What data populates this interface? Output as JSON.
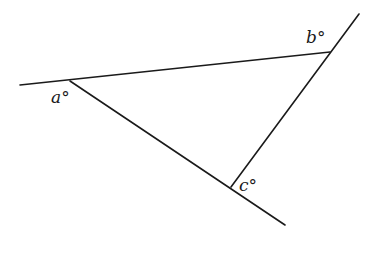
{
  "diagram": {
    "type": "geometry-triangle-extended-lines",
    "canvas": {
      "width": 371,
      "height": 255,
      "background": "#ffffff"
    },
    "stroke_color": "#1a1a1a",
    "lines": [
      {
        "id": "top-line",
        "x1": 20,
        "y1": 85,
        "x2": 330,
        "y2": 52
      },
      {
        "id": "right-line",
        "x1": 359,
        "y1": 14,
        "x2": 231,
        "y2": 187
      },
      {
        "id": "diagonal-line",
        "x1": 70,
        "y1": 81,
        "x2": 285,
        "y2": 225
      }
    ],
    "vertices": {
      "a": {
        "x": 70,
        "y": 81
      },
      "b": {
        "x": 330,
        "y": 52
      },
      "c": {
        "x": 231,
        "y": 187
      }
    },
    "labels": [
      {
        "id": "angle-a",
        "text": "a°",
        "x": 51,
        "y": 103
      },
      {
        "id": "angle-b",
        "text": "b°",
        "x": 306,
        "y": 43
      },
      {
        "id": "angle-c",
        "text": "c°",
        "x": 239,
        "y": 191
      }
    ]
  }
}
